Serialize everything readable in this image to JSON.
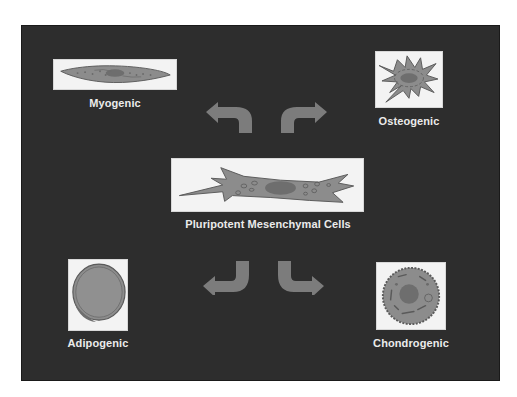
{
  "diagram": {
    "colors": {
      "background": "#2d2d2d",
      "box": "#f3f3f3",
      "label": "#ebebeb",
      "arrow": "#7c7c7c",
      "cell_fill": "#8c8c8c",
      "cell_outline": "#5a5a5a",
      "nucleus": "#6e6e6e"
    },
    "center": {
      "label": "Pluripotent Mesenchymal Cells"
    },
    "lineages": [
      {
        "id": "myogenic",
        "label": "Myogenic",
        "position": "top-left"
      },
      {
        "id": "osteogenic",
        "label": "Osteogenic",
        "position": "top-right"
      },
      {
        "id": "adipogenic",
        "label": "Adipogenic",
        "position": "bottom-left"
      },
      {
        "id": "chondrogenic",
        "label": "Chondrogenic",
        "position": "bottom-right"
      }
    ],
    "arrows": [
      {
        "from": "center",
        "to": "myogenic",
        "icon": "curved-arrow-up-left"
      },
      {
        "from": "center",
        "to": "osteogenic",
        "icon": "curved-arrow-up-right"
      },
      {
        "from": "center",
        "to": "adipogenic",
        "icon": "curved-arrow-down-left"
      },
      {
        "from": "center",
        "to": "chondrogenic",
        "icon": "curved-arrow-down-right"
      }
    ]
  }
}
